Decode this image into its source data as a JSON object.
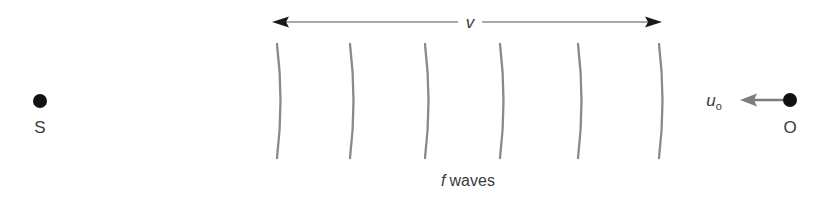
{
  "diagram": {
    "background_color": "#ffffff",
    "width": 827,
    "height": 198
  },
  "source": {
    "label": "S",
    "dot_color": "#121212",
    "dot_x": 40,
    "dot_y": 101,
    "dot_radius": 7,
    "label_x": 40,
    "label_y": 133
  },
  "observer": {
    "label": "O",
    "dot_color": "#121212",
    "dot_x": 790,
    "dot_y": 100,
    "dot_radius": 7,
    "label_x": 790,
    "label_y": 133,
    "velocity_label_main": "u",
    "velocity_label_sub": "o",
    "velocity_label_x": 714,
    "velocity_label_y": 106,
    "arrow_color": "#7d7d7d",
    "arrow_from_x": 786,
    "arrow_to_x": 740,
    "arrow_y": 100,
    "arrow_direction": "left"
  },
  "wave_speed_axis": {
    "label": "v",
    "label_x": 470,
    "label_y": 28,
    "line_color": "#555555",
    "head_color": "#1a1a1a",
    "y": 22,
    "left_tip_x": 272,
    "right_tip_x": 662,
    "gap_left_x": 458,
    "gap_right_x": 482,
    "direction": "double"
  },
  "wavefronts": {
    "label": "f waves",
    "label_italic_part": "f",
    "label_roman_part": "waves",
    "label_x": 468,
    "label_y": 186,
    "color": "#8a8a8a",
    "count": 6,
    "top_y": 44,
    "bottom_y": 158,
    "bulge": 7,
    "x_positions": [
      277,
      350,
      425,
      500,
      578,
      659
    ]
  },
  "chart_data": {
    "type": "diagram",
    "annotations": [
      "S",
      "O",
      "v",
      "u",
      "o",
      "f waves"
    ],
    "elements": [
      {
        "name": "source-point",
        "label": "S",
        "x": 40,
        "y": 101
      },
      {
        "name": "observer-point",
        "label": "O",
        "x": 790,
        "y": 100
      },
      {
        "name": "wave-speed-arrow",
        "label": "v",
        "span_x": [
          272,
          662
        ],
        "y": 22
      },
      {
        "name": "observer-velocity-arrow",
        "label": "u_o",
        "span_x": [
          740,
          786
        ],
        "y": 100
      },
      {
        "name": "wavefronts",
        "label": "f waves",
        "count": 6,
        "span_x": [
          277,
          659
        ]
      }
    ]
  }
}
